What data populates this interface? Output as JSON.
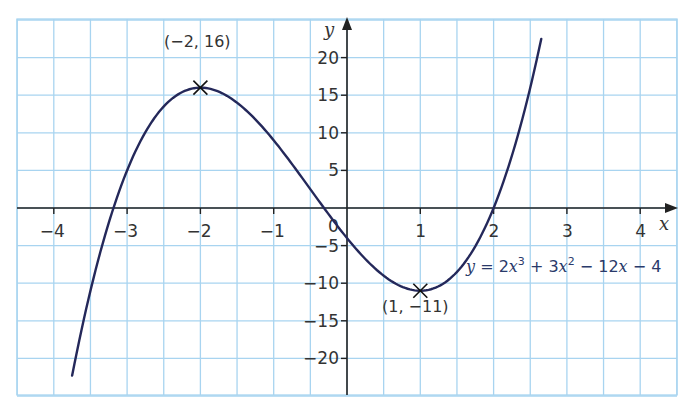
{
  "chart_data": {
    "type": "line",
    "title": "",
    "xlabel": "x",
    "ylabel": "y",
    "xlim": [
      -4.5,
      4.5
    ],
    "ylim": [
      -25,
      25
    ],
    "grid": true,
    "legend": null,
    "x_ticks": [
      -4,
      -3,
      -2,
      -1,
      0,
      1,
      2,
      3,
      4
    ],
    "x_tick_labels": [
      "−4",
      "−3",
      "−2",
      "−1",
      "0",
      "1",
      "2",
      "3",
      "4"
    ],
    "y_ticks": [
      20,
      15,
      10,
      5,
      -5,
      -10,
      -15,
      -20
    ],
    "y_tick_labels": [
      "20",
      "15",
      "10",
      "5",
      "−5",
      "−10",
      "−15",
      "−20"
    ],
    "series": [
      {
        "name": "y = 2x³ + 3x² − 12x − 4",
        "equation": "y = 2x^3 + 3x^2 - 12x - 4",
        "coefficients": [
          2,
          3,
          -12,
          -4
        ],
        "x_range": [
          -3.75,
          2.65
        ],
        "x": [
          -3.75,
          -3.5,
          -3.25,
          -3,
          -2.5,
          -2,
          -1.5,
          -1,
          -0.5,
          0,
          0.5,
          1,
          1.5,
          2,
          2.5,
          2.65
        ],
        "y": [
          -22.0,
          -11.5,
          -3.6,
          5,
          14.5,
          16,
          12.5,
          9,
          2.5,
          -4,
          -9,
          -11,
          -8.5,
          0,
          14.5,
          22.0
        ]
      }
    ],
    "annotations": [
      {
        "label": "(−2, 16)",
        "x": -2,
        "y": 16,
        "marker": "cross",
        "type": "local maximum"
      },
      {
        "label": "(1, −11)",
        "x": 1,
        "y": -11,
        "marker": "cross",
        "type": "local minimum"
      }
    ]
  },
  "labels": {
    "x_axis": "x",
    "y_axis": "y",
    "origin": "0",
    "max_point": "(−2, 16)",
    "min_point": "(1, −11)",
    "equation_y": "y",
    "equation_eq": " = 2",
    "equation_x1": "x",
    "equation_sup1": "3",
    "equation_p2": " + 3",
    "equation_x2": "x",
    "equation_sup2": "2",
    "equation_p3": " − 12",
    "equation_x3": "x",
    "equation_p4": " − 4"
  },
  "colors": {
    "grid": "#a8d4f0",
    "axis": "#222222",
    "curve": "#24285a",
    "text": "#333333"
  }
}
